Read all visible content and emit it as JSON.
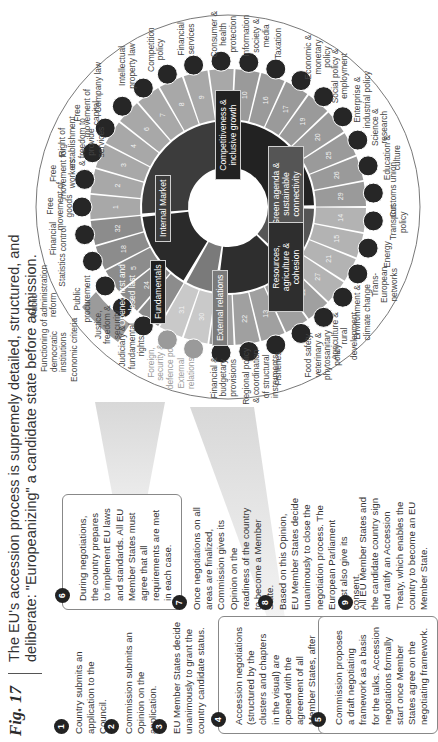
{
  "figure": {
    "label": "Fig. 17",
    "title_line1": "The EU's accession process is supremely detailed, structured, and",
    "title_line2": "deliberate: \"Europeanizing\" a candidate state before admission."
  },
  "steps": [
    {
      "n": "1",
      "text": "Country submits an application to the Council."
    },
    {
      "n": "2",
      "text": "Commission submits an Opinion on the application."
    },
    {
      "n": "3",
      "text": "EU Member States decide unanimously to grant the country candidate status."
    },
    {
      "n": "4",
      "text": "Accession negotiations (structured by the clusters and chapters in the visual) are opened with the agreement of all Member States, after conditions are met."
    },
    {
      "n": "5",
      "text": "Commission proposes a draft negotiating framework as a basis for the talks. Accession negotiations formally start once Member States agree on the negotiating framework."
    },
    {
      "n": "6",
      "text": "During negotiations, the country prepares to implement EU laws and standards. All EU Member States must agree that all requirements are met in each case."
    },
    {
      "n": "7",
      "text": "Once negotiations on all areas are finalized, Commission gives its Opinion on the readiness of the country to become a Member State."
    },
    {
      "n": "8",
      "text": "Based on this Opinion, EU Member States decide unanimously to close the negotiation process. The European Parliament must also give its consent."
    },
    {
      "n": "9",
      "text": "All EU Member States and the candidate country sign and ratify an Accession Treaty, which enables the country to become an EU Member State."
    }
  ],
  "wheel": {
    "center_labels": {
      "opened_first": "Opened first and closed last"
    },
    "clusters": [
      {
        "name": "Fundamentals",
        "color": "#2a2a2a"
      },
      {
        "name": "Internal Market",
        "color": "#3c3c3c"
      },
      {
        "name": "Competitiveness & inclusive growth",
        "color": "#222222"
      },
      {
        "name": "Green agenda & sustainable connectivity",
        "color": "#555555"
      },
      {
        "name": "Resources, agriculture & cohesion",
        "color": "#2e2e2e"
      },
      {
        "name": "External relations",
        "color": "#7a7a7a"
      }
    ],
    "extra_band": {
      "label": "Economic criteria"
    },
    "fundamentals_extra": [
      {
        "label": "Functioning of democratic institutions"
      },
      {
        "label": "Public administration reform"
      }
    ],
    "chapters": [
      {
        "num": "23",
        "label": "Judiciary & fundamental rights",
        "cluster": "Fundamentals"
      },
      {
        "num": "24",
        "label": "Justice, freedom & security",
        "cluster": "Fundamentals"
      },
      {
        "num": "5",
        "label": "Public procurement",
        "cluster": "Fundamentals"
      },
      {
        "num": "18",
        "label": "Statistics",
        "cluster": "Fundamentals"
      },
      {
        "num": "32",
        "label": "Financial control",
        "cluster": "Fundamentals"
      },
      {
        "num": "1",
        "label": "Free movement of goods",
        "cluster": "Internal Market"
      },
      {
        "num": "2",
        "label": "Free movement for workers",
        "cluster": "Internal Market"
      },
      {
        "num": "3",
        "label": "Right of establishment & freedom to provide services",
        "cluster": "Internal Market"
      },
      {
        "num": "4",
        "label": "Free movement of capital",
        "cluster": "Internal Market"
      },
      {
        "num": "6",
        "label": "Company law",
        "cluster": "Internal Market"
      },
      {
        "num": "7",
        "label": "Intellectual property law",
        "cluster": "Internal Market"
      },
      {
        "num": "8",
        "label": "Competition policy",
        "cluster": "Internal Market"
      },
      {
        "num": "9",
        "label": "Financial services",
        "cluster": "Internal Market"
      },
      {
        "num": "28",
        "label": "Consumer & health protection",
        "cluster": "Internal Market"
      },
      {
        "num": "10",
        "label": "Information society & media",
        "cluster": "Competitiveness & inclusive growth"
      },
      {
        "num": "16",
        "label": "Taxation",
        "cluster": "Competitiveness & inclusive growth"
      },
      {
        "num": "17",
        "label": "Economic & monetary policy",
        "cluster": "Competitiveness & inclusive growth"
      },
      {
        "num": "19",
        "label": "Social policy & employment",
        "cluster": "Competitiveness & inclusive growth"
      },
      {
        "num": "20",
        "label": "Enterprise & industrial policy",
        "cluster": "Competitiveness & inclusive growth"
      },
      {
        "num": "25",
        "label": "Science & research",
        "cluster": "Competitiveness & inclusive growth"
      },
      {
        "num": "26",
        "label": "Education & culture",
        "cluster": "Competitiveness & inclusive growth"
      },
      {
        "num": "29",
        "label": "Customs union",
        "cluster": "Competitiveness & inclusive growth"
      },
      {
        "num": "14",
        "label": "Transport policy",
        "cluster": "Green agenda & sustainable connectivity"
      },
      {
        "num": "15",
        "label": "Energy",
        "cluster": "Green agenda & sustainable connectivity"
      },
      {
        "num": "21",
        "label": "Trans-European networks",
        "cluster": "Green agenda & sustainable connectivity"
      },
      {
        "num": "27",
        "label": "Environment & climate change",
        "cluster": "Green agenda & sustainable connectivity"
      },
      {
        "num": "11",
        "label": "Agriculture & rural development",
        "cluster": "Resources, agriculture & cohesion"
      },
      {
        "num": "12",
        "label": "Food safety, veterinary & phytosanitary policy",
        "cluster": "Resources, agriculture & cohesion"
      },
      {
        "num": "13",
        "label": "Fisheries",
        "cluster": "Resources, agriculture & cohesion"
      },
      {
        "num": "22",
        "label": "Regional policy & coordination of structural instruments",
        "cluster": "Resources, agriculture & cohesion"
      },
      {
        "num": "33",
        "label": "Financial & budgetary provisions",
        "cluster": "Resources, agriculture & cohesion"
      },
      {
        "num": "30",
        "label": "External relations",
        "cluster": "External relations"
      },
      {
        "num": "31",
        "label": "Foreign, security & defence policy",
        "cluster": "External relations"
      }
    ]
  }
}
